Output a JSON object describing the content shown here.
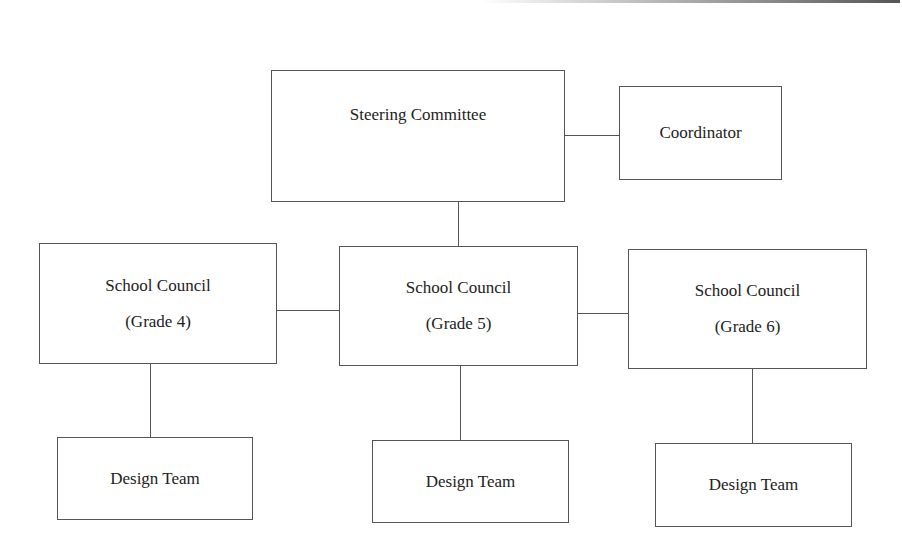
{
  "diagram": {
    "type": "organizational-chart",
    "nodes": {
      "steering": {
        "label": "Steering Committee"
      },
      "coordinator": {
        "label": "Coordinator"
      },
      "council_g4": {
        "title": "School Council",
        "subtitle": "(Grade 4)"
      },
      "council_g5": {
        "title": "School Council",
        "subtitle": "(Grade 5)"
      },
      "council_g6": {
        "title": "School Council",
        "subtitle": "(Grade 6)"
      },
      "design_g4": {
        "label": "Design Team"
      },
      "design_g5": {
        "label": "Design Team"
      },
      "design_g6": {
        "label": "Design Team"
      }
    },
    "edges": [
      [
        "steering",
        "coordinator"
      ],
      [
        "steering",
        "council_g5"
      ],
      [
        "council_g4",
        "council_g5"
      ],
      [
        "council_g5",
        "council_g6"
      ],
      [
        "council_g4",
        "design_g4"
      ],
      [
        "council_g5",
        "design_g5"
      ],
      [
        "council_g6",
        "design_g6"
      ]
    ]
  }
}
